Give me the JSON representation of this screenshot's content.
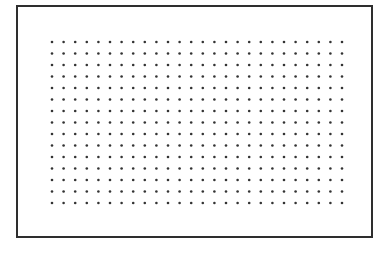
{
  "figure": {
    "frame": {
      "x": 16,
      "y": 5,
      "width": 357,
      "height": 233,
      "stroke": "#2e2e2e"
    },
    "dot_grid": {
      "rows": 15,
      "columns": 26,
      "origin_x": 52,
      "origin_y": 42,
      "spacing_x": 11.6,
      "spacing_y": 11.5,
      "dot_radius": 1.3,
      "dot_color": "#333333"
    }
  }
}
